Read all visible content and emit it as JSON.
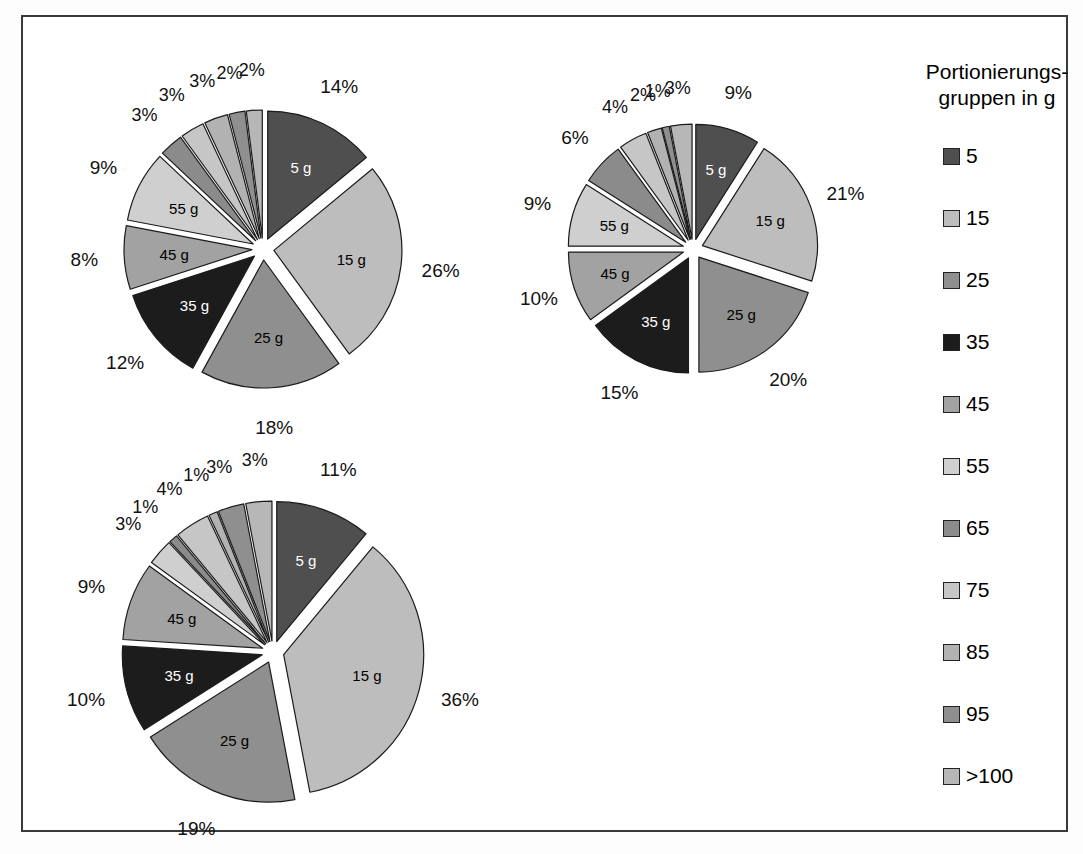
{
  "figure": {
    "border_color": "#3a3a3a",
    "background": "#ffffff"
  },
  "legend": {
    "title": "Portionierungs-\ngruppen in g",
    "title_line1": "Portionierungs-",
    "title_line2": "gruppen in g",
    "items": [
      {
        "label": "5",
        "color": "#4f4f4f"
      },
      {
        "label": "15",
        "color": "#bdbdbd"
      },
      {
        "label": "25",
        "color": "#8f8f8f"
      },
      {
        "label": "35",
        "color": "#1c1c1c"
      },
      {
        "label": "45",
        "color": "#a2a2a2"
      },
      {
        "label": "55",
        "color": "#cfcfcf"
      },
      {
        "label": "65",
        "color": "#8b8b8b"
      },
      {
        "label": "75",
        "color": "#c6c6c6"
      },
      {
        "label": "85",
        "color": "#b2b2b2"
      },
      {
        "label": "95",
        "color": "#8f8f8f"
      },
      {
        "label": ">100",
        "color": "#b7b7b7"
      }
    ]
  },
  "chart_data": [
    {
      "type": "pie",
      "id": "pie-top-left",
      "title": "",
      "categories": [
        "5 g",
        "15 g",
        "25 g",
        "35 g",
        "45 g",
        "55 g",
        "65 g",
        "75 g",
        "85 g",
        "95 g",
        ">100 g"
      ],
      "values": [
        14,
        26,
        18,
        12,
        8,
        9,
        3,
        3,
        3,
        2,
        2
      ],
      "value_labels": [
        "14%",
        "26%",
        "18%",
        "12%",
        "8%",
        "9%",
        "3%",
        "3%",
        "3%",
        "2%",
        "2%"
      ],
      "inner_labels": [
        "5 g",
        "15 g",
        "25 g",
        "35 g",
        "45 g",
        "55 g",
        "",
        "",
        "",
        "",
        ""
      ],
      "colors": [
        "#4f4f4f",
        "#bdbdbd",
        "#8f8f8f",
        "#1c1c1c",
        "#a2a2a2",
        "#cfcfcf",
        "#8b8b8b",
        "#c6c6c6",
        "#b2b2b2",
        "#8f8f8f",
        "#b7b7b7"
      ],
      "exploded": true,
      "legend": "shared"
    },
    {
      "type": "pie",
      "id": "pie-top-right",
      "title": "",
      "categories": [
        "5 g",
        "15 g",
        "25 g",
        "35 g",
        "45 g",
        "55 g",
        "65 g",
        "75 g",
        "85 g",
        "95 g",
        ">100 g"
      ],
      "values": [
        9,
        21,
        20,
        15,
        10,
        9,
        6,
        4,
        2,
        1,
        3
      ],
      "value_labels": [
        "9%",
        "21%",
        "20%",
        "15%",
        "10%",
        "9%",
        "6%",
        "4%",
        "2%",
        "1%",
        "3%"
      ],
      "inner_labels": [
        "5 g",
        "15 g",
        "25 g",
        "35 g",
        "45 g",
        "55 g",
        "",
        "",
        "",
        "",
        ""
      ],
      "colors": [
        "#4f4f4f",
        "#bdbdbd",
        "#8f8f8f",
        "#1c1c1c",
        "#a2a2a2",
        "#cfcfcf",
        "#8b8b8b",
        "#c6c6c6",
        "#b2b2b2",
        "#8f8f8f",
        "#b7b7b7"
      ],
      "exploded": true,
      "legend": "shared"
    },
    {
      "type": "pie",
      "id": "pie-bottom-left",
      "title": "",
      "categories": [
        "5 g",
        "15 g",
        "25 g",
        "35 g",
        "45 g",
        "55 g",
        "65 g",
        "75 g",
        "85 g",
        "95 g",
        ">100 g"
      ],
      "values": [
        11,
        36,
        19,
        10,
        9,
        3,
        1,
        4,
        1,
        3,
        3
      ],
      "value_labels": [
        "11%",
        "36%",
        "19%",
        "10%",
        "9%",
        "3%",
        "1%",
        "4%",
        "1%",
        "3%",
        "3%"
      ],
      "inner_labels": [
        "5 g",
        "15 g",
        "25 g",
        "35 g",
        "45 g",
        "",
        "",
        "",
        "",
        "",
        ""
      ],
      "colors": [
        "#4f4f4f",
        "#bdbdbd",
        "#8f8f8f",
        "#1c1c1c",
        "#a2a2a2",
        "#cfcfcf",
        "#8b8b8b",
        "#c6c6c6",
        "#b2b2b2",
        "#8f8f8f",
        "#b7b7b7"
      ],
      "exploded": true,
      "legend": "shared"
    }
  ]
}
